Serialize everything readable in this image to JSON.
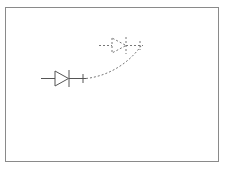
{
  "canvas": {
    "frame_color": "#8a8a8a",
    "stroke_color": "#555555",
    "ghost_color": "#777777"
  },
  "diagram": {
    "elements": [
      {
        "type": "diode",
        "style": "solid",
        "label": ""
      },
      {
        "type": "diode",
        "style": "dashed",
        "label": "",
        "role": "drag-preview"
      },
      {
        "type": "wire",
        "style": "dashed",
        "role": "connection-curve"
      }
    ]
  }
}
